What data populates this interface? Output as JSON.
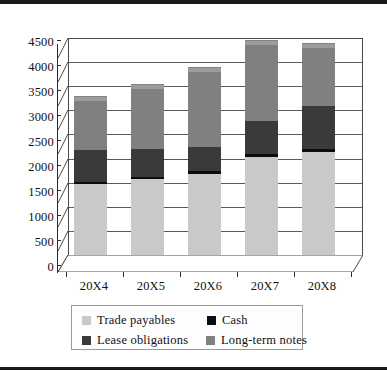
{
  "chart_data": {
    "type": "bar",
    "stacked": true,
    "title": "",
    "subtitle": "",
    "xlabel": "",
    "ylabel": "",
    "categories": [
      "20X4",
      "20X5",
      "20X6",
      "20X7",
      "20X8"
    ],
    "series": [
      {
        "name": "Trade payables",
        "color": "#c9c9c9",
        "values": [
          1480,
          1580,
          1690,
          2040,
          2140
        ]
      },
      {
        "name": "Cash",
        "color": "#0d0d0d",
        "values": [
          40,
          40,
          50,
          50,
          50
        ]
      },
      {
        "name": "Lease obligations",
        "color": "#3a3a3a",
        "values": [
          660,
          570,
          490,
          680,
          900
        ]
      },
      {
        "name": "Long-term notes",
        "color": "#808080",
        "values": [
          1020,
          1260,
          1570,
          1580,
          1210
        ]
      }
    ],
    "totals": [
      3200,
      3450,
      3800,
      4350,
      4300
    ],
    "ylim": [
      0,
      4500
    ],
    "ytick_step": 500,
    "yticks": [
      "4500",
      "4000",
      "3500",
      "3000",
      "2500",
      "2000",
      "1500",
      "1000",
      "500",
      "0"
    ],
    "grid": true,
    "legend_position": "bottom",
    "three_d": true
  },
  "legend": {
    "items": [
      {
        "label": "Trade payables",
        "color": "#c9c9c9"
      },
      {
        "label": "Cash",
        "color": "#0d0d0d"
      },
      {
        "label": "Lease obligations",
        "color": "#3a3a3a"
      },
      {
        "label": "Long-term notes",
        "color": "#808080"
      }
    ]
  },
  "colors": {
    "axis": "#2b2b2b",
    "grid": "#5a5a5a",
    "wall_border": "#4a4a4a",
    "background": "#ffffff",
    "rule": "#1a1a1a"
  }
}
